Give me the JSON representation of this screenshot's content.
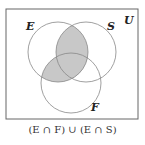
{
  "diagram": {
    "type": "venn",
    "universe_label": "U",
    "sets": [
      {
        "name": "E",
        "label": "E"
      },
      {
        "name": "S",
        "label": "S"
      },
      {
        "name": "F",
        "label": "F"
      }
    ],
    "shaded_region": "(E ∩ F) ∪ (E ∩ S)",
    "caption": "(E ∩ F) ∪ (E ∩ S)",
    "colors": {
      "shade": "#c8c8c8",
      "stroke": "#888888",
      "border": "#666666"
    }
  }
}
